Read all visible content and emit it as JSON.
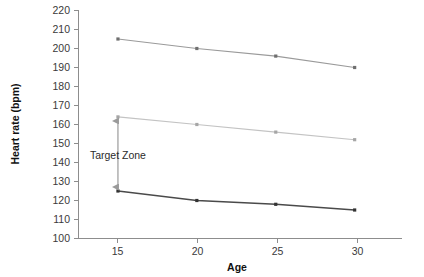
{
  "chart_data": {
    "type": "line",
    "title": "",
    "xlabel": "Age",
    "ylabel": "Heart rate (bpm)",
    "x": [
      15,
      20,
      25,
      30
    ],
    "xtick_labels": [
      "15",
      "20",
      "25",
      "30"
    ],
    "xlim": [
      12.5,
      33
    ],
    "ylim": [
      100,
      220
    ],
    "ytick_labels": [
      "100",
      "110",
      "120",
      "130",
      "140",
      "150",
      "160",
      "170",
      "180",
      "190",
      "200",
      "210",
      "220"
    ],
    "ytick_values": [
      100,
      110,
      120,
      130,
      140,
      150,
      160,
      170,
      180,
      190,
      200,
      210,
      220
    ],
    "grid": false,
    "legend": "none",
    "series": [
      {
        "name": "maximum-heart-rate",
        "values": [
          205,
          200,
          196,
          190
        ],
        "color": "#9a9a9a",
        "marker_color": "#6f6f6f",
        "width": 1.1
      },
      {
        "name": "upper-target-heart-rate",
        "values": [
          164,
          160,
          156,
          152
        ],
        "color": "#c3c3c3",
        "marker_color": "#a6a6a6",
        "width": 1.1
      },
      {
        "name": "lower-target-heart-rate",
        "values": [
          125,
          120,
          118,
          115
        ],
        "color": "#4a4a4a",
        "marker_color": "#333333",
        "width": 1.6
      }
    ],
    "annotations": [
      {
        "name": "target-zone",
        "label": "Target Zone",
        "x": 15,
        "y_from": 125,
        "y_to": 164,
        "arrow": "double",
        "color": "#9a9a9a",
        "label_color": "#2b2b2b"
      }
    ]
  }
}
